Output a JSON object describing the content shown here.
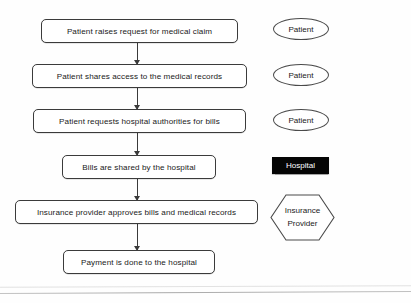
{
  "diagram": {
    "steps": [
      {
        "id": "step-1",
        "label": "Patient raises request for medical claim",
        "x": 41,
        "y": 19,
        "w": 197,
        "h": 24
      },
      {
        "id": "step-2",
        "label": "Patient shares access to the medical records",
        "x": 32,
        "y": 64,
        "w": 215,
        "h": 24
      },
      {
        "id": "step-3",
        "label": "Patient requests hospital authorities for bills",
        "x": 33,
        "y": 109,
        "w": 213,
        "h": 24
      },
      {
        "id": "step-4",
        "label": "Bills are shared by the hospital",
        "x": 62,
        "y": 155,
        "w": 154,
        "h": 24
      },
      {
        "id": "step-5",
        "label": "Insurance provider approves bills and medical records",
        "x": 15,
        "y": 200,
        "w": 243,
        "h": 24
      },
      {
        "id": "step-6",
        "label": "Payment is done to the hospital",
        "x": 63,
        "y": 250,
        "w": 152,
        "h": 24
      }
    ],
    "connectors": [
      {
        "id": "connector-1-2",
        "from": "step-1",
        "to": "step-2",
        "x": 136.6,
        "y": 43,
        "length": 21
      },
      {
        "id": "connector-2-3",
        "from": "step-2",
        "to": "step-3",
        "x": 136.6,
        "y": 88,
        "length": 21
      },
      {
        "id": "connector-3-4",
        "from": "step-3",
        "to": "step-4",
        "x": 136.6,
        "y": 133,
        "length": 22
      },
      {
        "id": "connector-4-5",
        "from": "step-4",
        "to": "step-5",
        "x": 136.6,
        "y": 179,
        "length": 21
      },
      {
        "id": "connector-5-6",
        "from": "step-5",
        "to": "step-6",
        "x": 136.6,
        "y": 224,
        "length": 26
      }
    ],
    "roles": [
      {
        "id": "role-patient-1",
        "label": "Patient",
        "shape": "ellipse",
        "x": 273,
        "y": 18,
        "w": 56,
        "h": 22
      },
      {
        "id": "role-patient-2",
        "label": "Patient",
        "shape": "ellipse",
        "x": 273,
        "y": 64,
        "w": 56,
        "h": 22
      },
      {
        "id": "role-patient-3",
        "label": "Patient",
        "shape": "ellipse",
        "x": 273,
        "y": 109,
        "w": 56,
        "h": 22
      },
      {
        "id": "role-hospital",
        "label": "Hospital",
        "shape": "rectangle",
        "x": 272,
        "y": 157,
        "w": 57,
        "h": 17,
        "fill": "#050505",
        "text_color": "#ffffff"
      },
      {
        "id": "role-insurance",
        "label_line1": "Insurance",
        "label_line2": "Provider",
        "shape": "hexagon",
        "x": 270,
        "y": 194,
        "w": 65,
        "h": 47
      }
    ],
    "colors": {
      "box_border": "#3b3b3b",
      "box_fill": "#ffffff",
      "connector": "#3a3a3a",
      "text": "#1a1a1a",
      "hospital_fill": "#050505",
      "hospital_text": "#ffffff",
      "background": "#fefefe"
    }
  }
}
